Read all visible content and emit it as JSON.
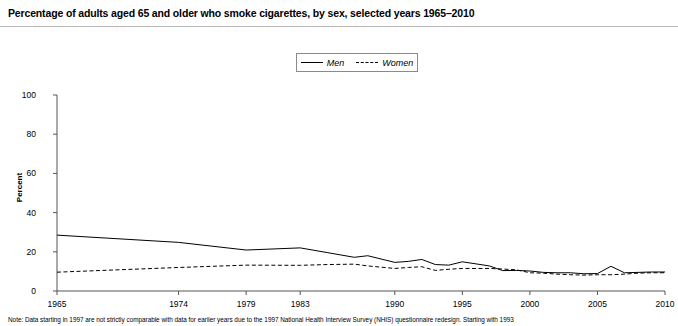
{
  "title": "Percentage of adults aged 65 and older who smoke cigarettes, by sex, selected years 1965–2010",
  "note": "Note: Data starting in 1997 are not strictly comparable with data for earlier years due to the 1997 National Health Interview Survey (NHIS) questionnaire redesign. Starting with 1993",
  "legend": {
    "men_label": "Men",
    "women_label": "Women"
  },
  "chart_data": {
    "type": "line",
    "title": "Percentage of adults aged 65 and older who smoke cigarettes, by sex, selected years 1965–2010",
    "xlabel": "",
    "ylabel": "Percent",
    "ylim": [
      0,
      100
    ],
    "xlim": [
      1965,
      2010
    ],
    "yticks": [
      0,
      20,
      40,
      60,
      80,
      100
    ],
    "ytick_labels": [
      "0",
      "20",
      "40",
      "60",
      "80",
      "100"
    ],
    "xticks": [
      1965,
      1974,
      1979,
      1983,
      1990,
      1995,
      2000,
      2005,
      2010
    ],
    "xtick_labels": [
      "1965",
      "1974",
      "1979",
      "1983",
      "1990",
      "1995",
      "2000",
      "2005",
      "2010"
    ],
    "grid": false,
    "legend_position": "top-center",
    "series": [
      {
        "name": "Men",
        "style": "solid",
        "color": "#000000",
        "x": [
          1965,
          1974,
          1979,
          1983,
          1985,
          1987,
          1988,
          1990,
          1991,
          1992,
          1993,
          1994,
          1995,
          1997,
          1998,
          1999,
          2000,
          2001,
          2002,
          2003,
          2004,
          2005,
          2006,
          2007,
          2008,
          2009,
          2010
        ],
        "values": [
          28.5,
          24.8,
          20.9,
          22.0,
          19.6,
          17.2,
          18.0,
          14.6,
          15.1,
          16.1,
          13.5,
          13.2,
          14.9,
          12.8,
          10.4,
          10.5,
          10.2,
          9.5,
          9.3,
          9.3,
          8.8,
          8.9,
          12.6,
          9.3,
          9.5,
          9.7,
          9.7
        ]
      },
      {
        "name": "Women",
        "style": "dashed",
        "color": "#000000",
        "x": [
          1965,
          1974,
          1979,
          1983,
          1985,
          1987,
          1988,
          1990,
          1991,
          1992,
          1993,
          1994,
          1995,
          1997,
          1998,
          1999,
          2000,
          2001,
          2002,
          2003,
          2004,
          2005,
          2006,
          2007,
          2008,
          2009,
          2010
        ],
        "values": [
          9.6,
          12.0,
          13.2,
          13.1,
          13.5,
          13.7,
          12.8,
          11.5,
          12.0,
          12.4,
          10.5,
          11.1,
          11.5,
          11.5,
          11.2,
          10.8,
          9.3,
          9.1,
          8.6,
          8.3,
          8.1,
          8.3,
          8.3,
          8.6,
          9.1,
          9.3,
          9.3
        ]
      }
    ]
  },
  "axis": {
    "y_title": "Percent"
  }
}
